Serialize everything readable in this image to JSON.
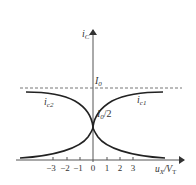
{
  "diagram": {
    "y_axis_label": "i",
    "y_axis_sub": "C",
    "x_axis_label": "u",
    "x_axis_sub": "X",
    "x_axis_label_div": "/V",
    "x_axis_label_div_sub": "T",
    "dashed_level_label": "I",
    "dashed_level_sub": "0",
    "center_label": "I",
    "center_sub": "0",
    "center_suffix": "/2",
    "curve1_label": "i",
    "curve1_sub": "c1",
    "curve2_label": "i",
    "curve2_sub": "c2",
    "ticks": [
      "−3",
      "−2",
      "−1",
      "0",
      "1",
      "2",
      "3"
    ]
  },
  "colors": {
    "curve": "#222222",
    "axis": "#555555",
    "dashed": "#666666"
  }
}
